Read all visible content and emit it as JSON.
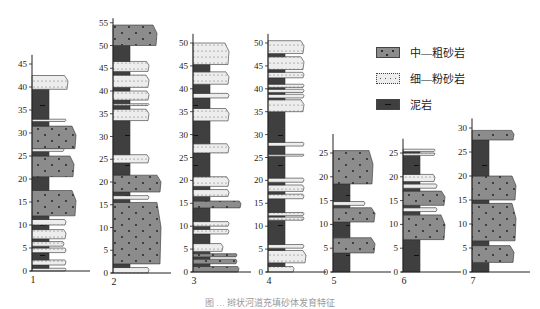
{
  "legend": {
    "items": [
      {
        "key": "coarse",
        "label": "中—粗砂岩",
        "color": "#8c8c8c"
      },
      {
        "key": "fine",
        "label": "细—粉砂岩",
        "color": "#ececec"
      },
      {
        "key": "mud",
        "label": "泥岩",
        "color": "#3f3f3f"
      }
    ]
  },
  "caption": "图 … 辫状河道充填砂体发育特征",
  "columns": [
    {
      "id": "1",
      "label": "1",
      "axis_x": 32,
      "y0": 271,
      "scale": 4.6,
      "ticks": [
        0,
        5,
        10,
        15,
        20,
        25,
        30,
        35,
        40,
        45
      ],
      "top": 47,
      "layers": [
        [
          "fine",
          0,
          0.6,
          34
        ],
        [
          "mud",
          0.6,
          1.3,
          0
        ],
        [
          "fine",
          1.3,
          2.4,
          34
        ],
        [
          "mud",
          2.4,
          4.0,
          0
        ],
        [
          "fine",
          4.0,
          5.0,
          34
        ],
        [
          "mud",
          5.0,
          5.4,
          0
        ],
        [
          "fine",
          5.4,
          6.4,
          32
        ],
        [
          "mud",
          6.4,
          7.0,
          0
        ],
        [
          "fine",
          7.0,
          9.0,
          34
        ],
        [
          "mud",
          9.0,
          10.0,
          0
        ],
        [
          "fine",
          10.0,
          11.2,
          34
        ],
        [
          "mud",
          11.2,
          12.0,
          0
        ],
        [
          "coarse",
          12.0,
          17.5,
          44
        ],
        [
          "mud",
          17.5,
          20.5,
          0
        ],
        [
          "coarse",
          20.5,
          25.0,
          42
        ],
        [
          "mud",
          25.0,
          26.0,
          0
        ],
        [
          "fine",
          26.0,
          26.6,
          32
        ],
        [
          "coarse",
          26.6,
          31.5,
          44
        ],
        [
          "mud",
          31.5,
          32.5,
          0
        ],
        [
          "fine",
          32.5,
          33.0,
          34
        ],
        [
          "mud",
          33.0,
          39.5,
          0
        ],
        [
          "fine",
          39.5,
          42.5,
          36
        ]
      ]
    },
    {
      "id": "2",
      "label": "2",
      "axis_x": 113,
      "y0": 273,
      "scale": 4.55,
      "ticks": [
        0,
        5,
        10,
        15,
        20,
        25,
        30,
        35,
        40,
        45,
        50,
        55
      ],
      "top": 56,
      "layers": [
        [
          "fine",
          0,
          1.2,
          36
        ],
        [
          "mud",
          1.2,
          2.0,
          0
        ],
        [
          "coarse",
          2.0,
          15.5,
          48
        ],
        [
          "mud",
          15.5,
          16.2,
          0
        ],
        [
          "fine",
          16.2,
          17.0,
          36
        ],
        [
          "mud",
          17.0,
          17.8,
          0
        ],
        [
          "coarse",
          17.8,
          21.5,
          48
        ],
        [
          "mud",
          21.5,
          24.2,
          0
        ],
        [
          "fine",
          24.2,
          26.0,
          36
        ],
        [
          "mud",
          26.0,
          33.5,
          0
        ],
        [
          "fine",
          33.5,
          36.0,
          36
        ],
        [
          "mud",
          36.0,
          36.8,
          0
        ],
        [
          "fine",
          36.8,
          37.2,
          36
        ],
        [
          "mud",
          37.2,
          38.0,
          0
        ],
        [
          "fine",
          38.0,
          40.0,
          36
        ],
        [
          "mud",
          40.0,
          40.8,
          0
        ],
        [
          "fine",
          40.8,
          43.5,
          36
        ],
        [
          "mud",
          43.5,
          44.3,
          0
        ],
        [
          "fine",
          44.3,
          46.5,
          36
        ],
        [
          "mud",
          46.5,
          50.0,
          0
        ],
        [
          "coarse",
          50.0,
          54.5,
          44
        ]
      ]
    },
    {
      "id": "3",
      "label": "3",
      "axis_x": 193,
      "y0": 272,
      "scale": 4.58,
      "ticks": [
        0,
        5,
        10,
        15,
        20,
        25,
        30,
        35,
        40,
        45,
        50
      ],
      "top": 52,
      "layers": [
        [
          "coarse",
          0,
          1.2,
          46
        ],
        [
          "mud",
          1.2,
          1.8,
          0
        ],
        [
          "coarse",
          1.8,
          2.8,
          44
        ],
        [
          "mud",
          2.8,
          3.3,
          0
        ],
        [
          "coarse",
          3.3,
          4.0,
          44
        ],
        [
          "mud",
          4.0,
          4.5,
          0
        ],
        [
          "fine",
          4.5,
          6.2,
          30
        ],
        [
          "mud",
          6.2,
          8.3,
          0
        ],
        [
          "fine",
          8.3,
          9.3,
          36
        ],
        [
          "mud",
          9.3,
          10.0,
          0
        ],
        [
          "fine",
          10.0,
          11.0,
          36
        ],
        [
          "mud",
          11.0,
          14.0,
          0
        ],
        [
          "coarse",
          14.0,
          15.5,
          48
        ],
        [
          "mud",
          15.5,
          16.5,
          0
        ],
        [
          "fine",
          16.5,
          18.0,
          36
        ],
        [
          "mud",
          18.0,
          18.7,
          0
        ],
        [
          "fine",
          18.7,
          20.8,
          36
        ],
        [
          "mud",
          20.8,
          26.0,
          0
        ],
        [
          "fine",
          26.0,
          28.0,
          36
        ],
        [
          "mud",
          28.0,
          33.0,
          0
        ],
        [
          "fine",
          33.0,
          35.7,
          36
        ],
        [
          "mud",
          35.7,
          38.0,
          0
        ],
        [
          "fine",
          38.0,
          39.0,
          36
        ],
        [
          "mud",
          39.0,
          41.0,
          0
        ],
        [
          "fine",
          41.0,
          43.7,
          36
        ],
        [
          "mud",
          43.7,
          45.3,
          0
        ],
        [
          "fine",
          45.3,
          50.0,
          36
        ]
      ]
    },
    {
      "id": "4",
      "label": "4",
      "axis_x": 268,
      "y0": 272,
      "scale": 4.58,
      "ticks": [
        0,
        5,
        10,
        15,
        20,
        25,
        30,
        35,
        40,
        45,
        50
      ],
      "top": 52,
      "layers": [
        [
          "fine",
          0,
          1.2,
          26
        ],
        [
          "mud",
          1.2,
          2.0,
          0
        ],
        [
          "fine",
          2.0,
          4.7,
          38
        ],
        [
          "mud",
          4.7,
          5.2,
          0
        ],
        [
          "fine",
          5.2,
          6.0,
          36
        ],
        [
          "mud",
          6.0,
          11.3,
          0
        ],
        [
          "fine",
          11.3,
          12.0,
          36
        ],
        [
          "mud",
          12.0,
          12.3,
          0
        ],
        [
          "fine",
          12.3,
          13.0,
          36
        ],
        [
          "mud",
          13.0,
          16.0,
          0
        ],
        [
          "fine",
          16.0,
          17.0,
          36
        ],
        [
          "mud",
          17.0,
          17.6,
          0
        ],
        [
          "fine",
          17.6,
          19.0,
          36
        ],
        [
          "mud",
          19.0,
          19.6,
          0
        ],
        [
          "fine",
          19.6,
          20.5,
          36
        ],
        [
          "mud",
          20.5,
          25.3,
          0
        ],
        [
          "fine",
          25.3,
          25.7,
          36
        ],
        [
          "mud",
          25.7,
          27.5,
          0
        ],
        [
          "fine",
          27.5,
          28.3,
          36
        ],
        [
          "mud",
          28.3,
          35.0,
          0
        ],
        [
          "fine",
          35.0,
          37.6,
          36
        ],
        [
          "mud",
          37.6,
          38.0,
          0
        ],
        [
          "fine",
          38.0,
          38.8,
          36
        ],
        [
          "mud",
          38.8,
          39.2,
          0
        ],
        [
          "fine",
          39.2,
          39.9,
          36
        ],
        [
          "mud",
          39.9,
          40.3,
          0
        ],
        [
          "fine",
          40.3,
          41.0,
          36
        ],
        [
          "mud",
          41.0,
          42.4,
          0
        ],
        [
          "fine",
          42.4,
          43.6,
          36
        ],
        [
          "mud",
          43.6,
          44.2,
          0
        ],
        [
          "fine",
          44.2,
          47.0,
          36
        ],
        [
          "mud",
          47.0,
          47.7,
          0
        ],
        [
          "fine",
          47.7,
          50.5,
          36
        ]
      ]
    },
    {
      "id": "5",
      "label": "5",
      "axis_x": 333,
      "y0": 272,
      "scale": 4.76,
      "ticks": [
        0,
        5,
        10,
        15,
        20,
        25
      ],
      "top": 29,
      "layers": [
        [
          "mud",
          0,
          4.0,
          0
        ],
        [
          "coarse",
          4.0,
          7.2,
          42
        ],
        [
          "mud",
          7.2,
          10.5,
          0
        ],
        [
          "coarse",
          10.5,
          13.5,
          42
        ],
        [
          "mud",
          13.5,
          14.0,
          0
        ],
        [
          "fine",
          14.0,
          14.8,
          32
        ],
        [
          "mud",
          14.8,
          18.5,
          0
        ],
        [
          "coarse",
          18.5,
          25.5,
          40
        ]
      ]
    },
    {
      "id": "6",
      "label": "6",
      "axis_x": 403,
      "y0": 272,
      "scale": 4.76,
      "ticks": [
        0,
        5,
        10,
        15,
        20,
        25
      ],
      "top": 28,
      "layers": [
        [
          "mud",
          0,
          6.8,
          0
        ],
        [
          "coarse",
          6.8,
          12.0,
          42
        ],
        [
          "mud",
          12.0,
          12.7,
          0
        ],
        [
          "fine",
          12.7,
          13.5,
          34
        ],
        [
          "mud",
          13.5,
          14.0,
          0
        ],
        [
          "coarse",
          14.0,
          17.0,
          42
        ],
        [
          "mud",
          17.0,
          17.6,
          0
        ],
        [
          "fine",
          17.6,
          18.5,
          34
        ],
        [
          "mud",
          18.5,
          19.0,
          0
        ],
        [
          "fine",
          19.0,
          20.5,
          32
        ],
        [
          "mud",
          20.5,
          24.5,
          0
        ],
        [
          "fine",
          24.5,
          25.0,
          32
        ],
        [
          "mud",
          25.0,
          25.3,
          0
        ],
        [
          "fine",
          25.3,
          25.8,
          32
        ]
      ]
    },
    {
      "id": "7",
      "label": "7",
      "axis_x": 472,
      "y0": 272,
      "scale": 4.8,
      "ticks": [
        0,
        5,
        10,
        15,
        20,
        25,
        30
      ],
      "top": 32,
      "layers": [
        [
          "mud",
          0,
          2.0,
          0
        ],
        [
          "coarse",
          2.0,
          5.5,
          42
        ],
        [
          "mud",
          5.5,
          6.5,
          0
        ],
        [
          "coarse",
          6.5,
          14.3,
          44
        ],
        [
          "mud",
          14.3,
          15.0,
          0
        ],
        [
          "coarse",
          15.0,
          20.0,
          44
        ],
        [
          "mud",
          20.0,
          27.5,
          0
        ],
        [
          "coarse",
          27.5,
          29.5,
          42
        ]
      ]
    }
  ]
}
